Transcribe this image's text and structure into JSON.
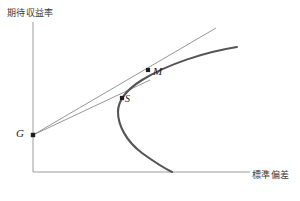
{
  "figure": {
    "background_color": "#ffffff",
    "width": 300,
    "height": 201
  },
  "axes": {
    "y_label": "期待収益率",
    "x_label": "標準偏差",
    "axis_color": "#9a9a9a",
    "origin": [
      33,
      172
    ],
    "y_axis_top": [
      33,
      22
    ],
    "x_axis_right": [
      250,
      172
    ]
  },
  "chart_data": {
    "type": "line",
    "title": "",
    "xlabel": "標準偏差",
    "ylabel": "期待収益率",
    "grid": false,
    "legend": "none",
    "series": [
      {
        "name": "efficient-frontier-curve",
        "description": "rightward-opening parabola (minimum variance frontier)",
        "color": "#555555",
        "width": 2.1,
        "path_points": [
          [
            237,
            47
          ],
          [
            200,
            54
          ],
          [
            170,
            64
          ],
          [
            148,
            75
          ],
          [
            132,
            89
          ],
          [
            121,
            103
          ],
          [
            118,
            112
          ],
          [
            121,
            123
          ],
          [
            130,
            137
          ],
          [
            144,
            152
          ],
          [
            160,
            165
          ],
          [
            172,
            172
          ]
        ]
      },
      {
        "name": "tangent-line-through-M",
        "description": "capital allocation line from G tangent to frontier at M",
        "color": "#8a8a8a",
        "width": 0.9,
        "from": [
          33,
          135
        ],
        "to": [
          216,
          28
        ]
      },
      {
        "name": "secant-line-through-S",
        "description": "line from G through inefficient portfolio S",
        "color": "#8a8a8a",
        "width": 0.9,
        "from": [
          33,
          135
        ],
        "to": [
          150,
          80
        ]
      }
    ],
    "points": [
      {
        "label": "G",
        "x": 33,
        "y": 135,
        "marker": "square",
        "note": "risk-free / intercept point on vertical axis"
      },
      {
        "label": "S",
        "x": 122,
        "y": 98,
        "marker": "square",
        "note": "portfolio on lower segment near frontier"
      },
      {
        "label": "M",
        "x": 148,
        "y": 70,
        "marker": "square",
        "note": "tangency portfolio"
      }
    ]
  },
  "labels": {
    "point_M": "M",
    "point_S": "S",
    "point_G": "G"
  }
}
